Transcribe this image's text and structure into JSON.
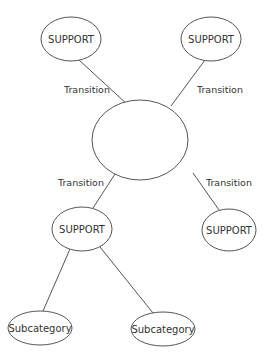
{
  "diagram": {
    "type": "concept-map",
    "colors": {
      "stroke": "#555555",
      "text": "#333333",
      "background": "#ffffff"
    },
    "nodes": [
      {
        "id": "center",
        "label": "",
        "cx": 140,
        "cy": 140,
        "rx": 48,
        "ry": 40
      },
      {
        "id": "support_top_left",
        "label": "SUPPORT",
        "cx": 71,
        "cy": 39,
        "rx": 30,
        "ry": 22
      },
      {
        "id": "support_top_right",
        "label": "SUPPORT",
        "cx": 211,
        "cy": 39,
        "rx": 30,
        "ry": 22
      },
      {
        "id": "support_mid_left",
        "label": "SUPPORT",
        "cx": 82,
        "cy": 229,
        "rx": 30,
        "ry": 22
      },
      {
        "id": "support_mid_right",
        "label": "SUPPORT",
        "cx": 229,
        "cy": 230,
        "rx": 27,
        "ry": 21
      },
      {
        "id": "subcategory_left",
        "label": "Subcategory",
        "cx": 40,
        "cy": 328,
        "rx": 32,
        "ry": 17
      },
      {
        "id": "subcategory_right",
        "label": "Subcategory",
        "cx": 163,
        "cy": 329,
        "rx": 32,
        "ry": 17
      }
    ],
    "edges": [
      {
        "from": "support_top_left",
        "to": "center",
        "label": "Transition",
        "x1": 79,
        "y1": 60,
        "x2": 128,
        "y2": 105,
        "lx": 64,
        "ly": 93
      },
      {
        "from": "support_top_right",
        "to": "center",
        "label": "Transition",
        "x1": 205,
        "y1": 60,
        "x2": 171,
        "y2": 106,
        "lx": 197,
        "ly": 93
      },
      {
        "from": "center",
        "to": "support_mid_left",
        "label": "Transition",
        "x1": 115,
        "y1": 174,
        "x2": 93,
        "y2": 208,
        "lx": 58,
        "ly": 186
      },
      {
        "from": "center",
        "to": "support_mid_right",
        "label": "Transition",
        "x1": 193,
        "y1": 173,
        "x2": 219,
        "y2": 210,
        "lx": 206,
        "ly": 186
      },
      {
        "from": "support_mid_left",
        "to": "subcategory_left",
        "label": "",
        "x1": 70,
        "y1": 249,
        "x2": 43,
        "y2": 311
      },
      {
        "from": "support_mid_left",
        "to": "subcategory_right",
        "label": "",
        "x1": 100,
        "y1": 247,
        "x2": 153,
        "y2": 313
      }
    ]
  }
}
